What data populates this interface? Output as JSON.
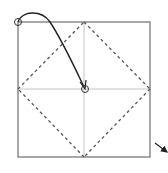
{
  "diagram": {
    "title": "",
    "kind": "origami-fold-instruction",
    "colors": {
      "border": "#8a8a8a",
      "fold_line": "#555555",
      "crease": "#c4c4c4",
      "arrow": "#222222",
      "background": "#ffffff"
    },
    "elements": {
      "paper_square": "square paper outline",
      "fold_lines": [
        "top-to-right dashed fold",
        "right-to-bottom dashed fold",
        "bottom-to-left dashed fold",
        "left-to-top dashed fold"
      ],
      "creases": [
        "horizontal center crease",
        "vertical center crease"
      ],
      "fold_arrow": "curved arrow from top-left corner to center",
      "corner_marker": "circle marking top-left corner",
      "center_marker": "circle marking center point",
      "turn_arrow": "small arrow at bottom-right pointing up-left"
    }
  }
}
